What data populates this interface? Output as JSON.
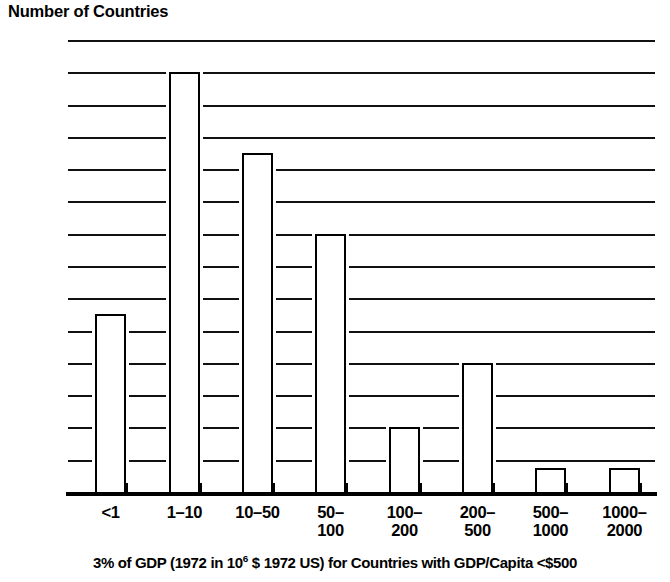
{
  "chart_data": {
    "type": "bar",
    "title": "Number of Countries",
    "ylabel": "Number of Countries",
    "xlabel": "3% of GDP (1972 in 10^6 $ 1972 US) for Countries with GDP/Capita <$500",
    "categories": [
      "<1",
      "1-10",
      "10-50",
      "50-100",
      "100-200",
      "200-500",
      "500-1000",
      "1000-2000"
    ],
    "category_lines": [
      [
        "<1"
      ],
      [
        "1–10"
      ],
      [
        "10–50"
      ],
      [
        "50–",
        "100"
      ],
      [
        "100–",
        "200"
      ],
      [
        "200–",
        "500"
      ],
      [
        "500–",
        "1000"
      ],
      [
        "1000–",
        "2000"
      ]
    ],
    "values": [
      11,
      26,
      21,
      16,
      4,
      8,
      1.5,
      1.5
    ],
    "ylim": [
      0,
      28
    ],
    "ytick_values": [
      0,
      2,
      4,
      6,
      8,
      10,
      12,
      14,
      16,
      18,
      20,
      22,
      24,
      26,
      28
    ],
    "ytick_labels": [
      "0",
      "2",
      "4",
      "6",
      "8",
      "10",
      "12",
      "14",
      "16",
      "18",
      "20",
      "22",
      "24",
      "26",
      "28"
    ],
    "grid": true,
    "grid_axis": "y",
    "legend": null,
    "bar_fill": "#ffffff",
    "bar_edge": "#000000",
    "axis_color": "#000000"
  },
  "caption": {
    "pre": "3% of GDP (1972 in 10",
    "sup": "6",
    "post": " $ 1972 US) for Countries with GDP/Capita <$500"
  }
}
